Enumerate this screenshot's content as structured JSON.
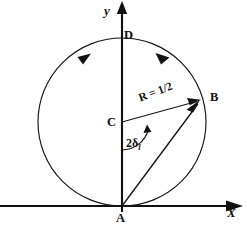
{
  "figure": {
    "kind": "argand-unitarity-circle-diagram",
    "background_color": "#ffffff",
    "ink_color": "#111111",
    "axes": {
      "x_label": "X",
      "y_label": "y",
      "x_axis_y_px": 206,
      "y_axis_x_px": 122,
      "x_arrow_direction": "right",
      "y_arrow_direction": "up"
    },
    "circle": {
      "center_label": "C",
      "center_px": [
        122,
        122
      ],
      "radius_px": 84,
      "radius_label": "R =",
      "radius_value": "1/2",
      "radius_value_numerator": "1",
      "radius_value_denominator": "2",
      "direction_markers": 2,
      "direction_sense": "clockwise"
    },
    "points": [
      {
        "id": "A",
        "label": "A",
        "x_px": 122,
        "y_px": 206,
        "note": "origin, circle tangent point on x-axis"
      },
      {
        "id": "B",
        "label": "B",
        "x_px": 201,
        "y_px": 99,
        "note": "point on circle, tip of amplitude vector"
      },
      {
        "id": "C",
        "label": "C",
        "x_px": 122,
        "y_px": 122,
        "note": "circle center on y-axis"
      },
      {
        "id": "D",
        "label": "D",
        "x_px": 122,
        "y_px": 38,
        "note": "top of circle on y-axis"
      }
    ],
    "vectors": [
      {
        "id": "AB",
        "from": "A",
        "to": "B",
        "arrow_at": "B"
      },
      {
        "id": "CB",
        "from": "C",
        "to": "B",
        "arrow_at": "B"
      }
    ],
    "angle": {
      "label_main": "2δ",
      "label_subscript": "l",
      "full_text": "2δl",
      "vertex": "C",
      "between": [
        "C-to-A (downward y)",
        "C-to-B (radius)"
      ]
    }
  }
}
